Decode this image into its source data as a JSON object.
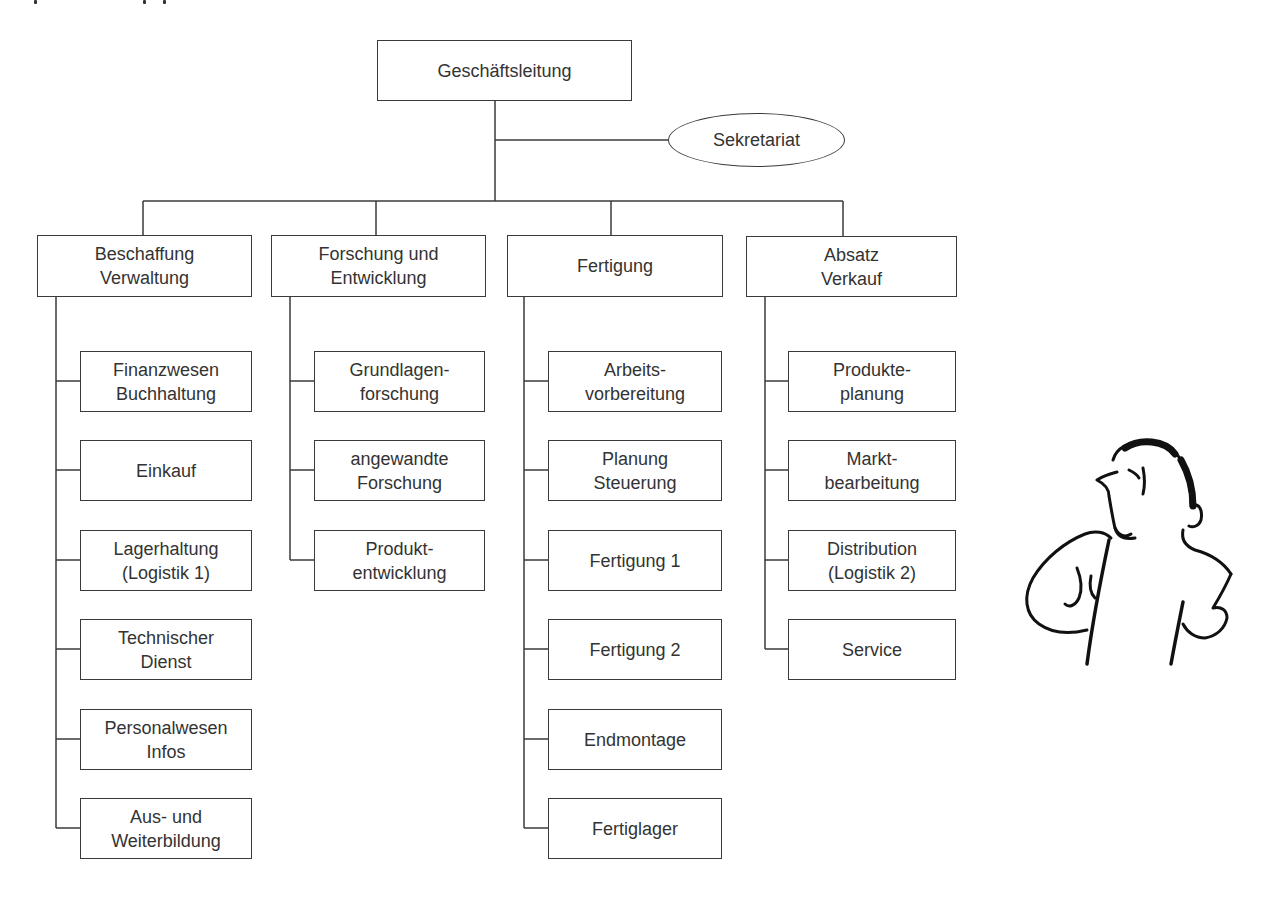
{
  "diagram": {
    "type": "organizational-chart",
    "root": {
      "label": "Geschäftsleitung"
    },
    "staff": {
      "label": "Sekretariat"
    },
    "departments": [
      {
        "lines": [
          "Beschaffung",
          "Verwaltung"
        ],
        "units": [
          [
            "Finanzwesen",
            "Buchhaltung"
          ],
          [
            "Einkauf"
          ],
          [
            "Lagerhaltung",
            "(Logistik 1)"
          ],
          [
            "Technischer",
            "Dienst"
          ],
          [
            "Personalwesen",
            "Infos"
          ],
          [
            "Aus- und",
            "Weiterbildung"
          ]
        ]
      },
      {
        "lines": [
          "Forschung und",
          "Entwicklung"
        ],
        "units": [
          [
            "Grundlagen-",
            "forschung"
          ],
          [
            "angewandte",
            "Forschung"
          ],
          [
            "Produkt-",
            "entwicklung"
          ]
        ]
      },
      {
        "lines": [
          "Fertigung"
        ],
        "units": [
          [
            "Arbeits-",
            "vorbereitung"
          ],
          [
            "Planung",
            "Steuerung"
          ],
          [
            "Fertigung 1"
          ],
          [
            "Fertigung 2"
          ],
          [
            "Endmontage"
          ],
          [
            "Fertiglager"
          ]
        ]
      },
      {
        "lines": [
          "Absatz",
          "Verkauf"
        ],
        "units": [
          [
            "Produkte-",
            "planung"
          ],
          [
            "Markt-",
            "bearbeitung"
          ],
          [
            "Distribution",
            "(Logistik 2)"
          ],
          [
            "Service"
          ]
        ]
      }
    ],
    "illustration": "thinking-man-cartoon",
    "colors": {
      "line": "#3a3a3a",
      "text": "#333333",
      "background": "#ffffff"
    }
  }
}
